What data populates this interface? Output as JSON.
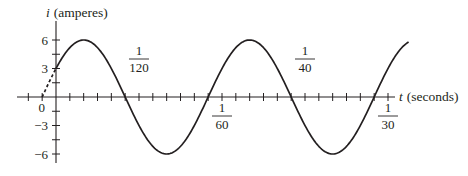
{
  "chart_data": {
    "type": "line",
    "title": "",
    "xlabel": "t (seconds)",
    "ylabel": "i (amperes)",
    "xlabel_var": "t",
    "xlabel_unit": "(seconds)",
    "ylabel_var": "i",
    "ylabel_unit": "(amperes)",
    "function_note": "i = 6 sin(120πt + π/6) — inferred from visible features (amplitude 6, i(0)=3, zero crossings ~1/720 s before labeled ticks), not printed in figure",
    "amplitude": 6,
    "y_ticks": [
      -6,
      -4.5,
      -3,
      -1.5,
      0,
      1.5,
      3,
      4.5,
      6
    ],
    "y_tick_labels": [
      {
        "value": 6,
        "label": "6"
      },
      {
        "value": 3,
        "label": "3"
      },
      {
        "value": 0,
        "label": "0"
      },
      {
        "value": -3,
        "label": "−3"
      },
      {
        "value": -6,
        "label": "−6"
      }
    ],
    "x_tick_step": "1/720",
    "x_tick_labels": [
      {
        "value": 0.008333,
        "num": "1",
        "den": "120",
        "position": "above"
      },
      {
        "value": 0.016667,
        "num": "1",
        "den": "60",
        "position": "below"
      },
      {
        "value": 0.025,
        "num": "1",
        "den": "40",
        "position": "above"
      },
      {
        "value": 0.033333,
        "num": "1",
        "den": "30",
        "position": "below"
      }
    ],
    "xlim": [
      -0.00625,
      0.0347
    ],
    "ylim": [
      -6.5,
      6.5
    ],
    "series": [
      {
        "name": "i(t)",
        "style": "solid",
        "t_range": [
          0,
          0.0354
        ]
      },
      {
        "name": "i(t) extension",
        "style": "dashed",
        "t_range": [
          -0.00139,
          0
        ]
      }
    ],
    "sample_points": [
      {
        "t": -0.001389,
        "i": 0
      },
      {
        "t": 0,
        "i": 3
      },
      {
        "t": 0.002778,
        "i": 6
      },
      {
        "t": 0.006944,
        "i": 0
      },
      {
        "t": 0.011111,
        "i": -6
      },
      {
        "t": 0.015278,
        "i": 0
      },
      {
        "t": 0.019444,
        "i": 6
      },
      {
        "t": 0.023611,
        "i": 0
      },
      {
        "t": 0.027778,
        "i": -6
      },
      {
        "t": 0.031944,
        "i": 0
      }
    ],
    "grid": false,
    "legend": null
  }
}
